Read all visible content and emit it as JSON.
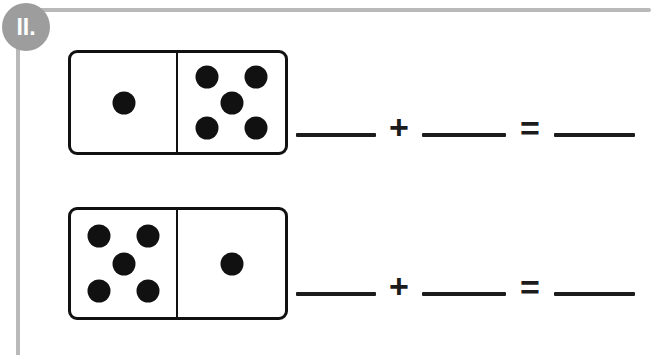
{
  "exercise": {
    "number_label": "II.",
    "badge_color": "#9d9d9d",
    "rail_color": "#b9b9b9"
  },
  "problems": [
    {
      "id": "problem-1",
      "domino": {
        "left_pips": 1,
        "right_pips": 5,
        "pip_color": "#111111",
        "border_color": "#111111"
      },
      "equation": {
        "addend1": "",
        "plus": "+",
        "addend2": "",
        "equals": "=",
        "sum": ""
      }
    },
    {
      "id": "problem-2",
      "domino": {
        "left_pips": 5,
        "right_pips": 1,
        "pip_color": "#111111",
        "border_color": "#111111"
      },
      "equation": {
        "addend1": "",
        "plus": "+",
        "addend2": "",
        "equals": "=",
        "sum": ""
      }
    }
  ]
}
